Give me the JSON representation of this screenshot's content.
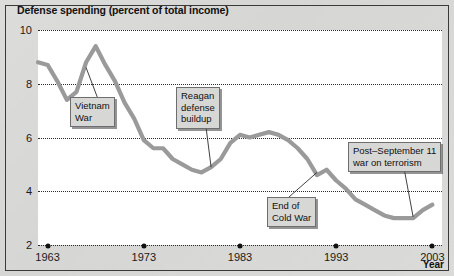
{
  "chart_data": {
    "type": "line",
    "title": "Defense spending (percent of total income)",
    "xlabel": "Year",
    "ylabel": "",
    "xlim": [
      1962,
      2004
    ],
    "ylim": [
      2,
      10
    ],
    "yticks": [
      10,
      8,
      6,
      4,
      2
    ],
    "xticks": [
      1963,
      1973,
      1983,
      1993,
      2003
    ],
    "grid": "horizontal-dotted",
    "legend": "none",
    "line_color": "#9a9a9a",
    "series": [
      {
        "name": "Defense spending",
        "x": [
          1962,
          1963,
          1964,
          1965,
          1966,
          1967,
          1968,
          1969,
          1970,
          1971,
          1972,
          1973,
          1974,
          1975,
          1976,
          1977,
          1978,
          1979,
          1980,
          1981,
          1982,
          1983,
          1984,
          1985,
          1986,
          1987,
          1988,
          1989,
          1990,
          1991,
          1992,
          1993,
          1994,
          1995,
          1996,
          1997,
          1998,
          1999,
          2000,
          2001,
          2002,
          2003
        ],
        "values": [
          8.8,
          8.7,
          8.1,
          7.4,
          7.7,
          8.8,
          9.4,
          8.7,
          8.1,
          7.3,
          6.7,
          5.9,
          5.6,
          5.6,
          5.2,
          5.0,
          4.8,
          4.7,
          4.9,
          5.2,
          5.8,
          6.1,
          6.0,
          6.1,
          6.2,
          6.1,
          5.9,
          5.6,
          5.2,
          4.6,
          4.8,
          4.4,
          4.1,
          3.7,
          3.5,
          3.3,
          3.1,
          3.0,
          3.0,
          3.0,
          3.3,
          3.5
        ]
      }
    ],
    "annotations": [
      {
        "id": "vietnam-war",
        "label": "Vietnam\nWar",
        "points_to_year": 1967,
        "points_to_value": 8.6
      },
      {
        "id": "reagan-defense-buildup",
        "label": "Reagan\ndefense\nbuildup",
        "points_to_year": 1980,
        "points_to_value": 4.9
      },
      {
        "id": "end-of-cold-war",
        "label": "End of\nCold War",
        "points_to_year": 1991,
        "points_to_value": 4.7
      },
      {
        "id": "post-september-11",
        "label": "Post–September 11\nwar on terrorism",
        "points_to_year": 2001,
        "points_to_value": 3.05
      }
    ]
  }
}
